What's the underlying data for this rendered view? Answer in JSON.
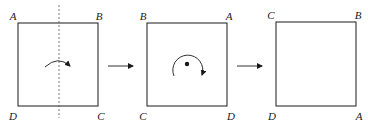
{
  "diagram": {
    "stroke_color": "#1a1a1a",
    "panels": [
      {
        "id": "panel-1",
        "labels": {
          "top_left": "A",
          "top_right": "B",
          "bottom_left": "D",
          "bottom_right": "C"
        },
        "annotation": "vertical dashed axis of reflection with curved flip arrow"
      },
      {
        "id": "panel-2",
        "labels": {
          "top_left": "B",
          "top_right": "A",
          "bottom_left": "C",
          "bottom_right": "D"
        },
        "annotation": "center point with clockwise rotation arrow"
      },
      {
        "id": "panel-3",
        "labels": {
          "top_left": "C",
          "top_right": "B",
          "bottom_left": "D",
          "bottom_right": "A"
        },
        "annotation": "result"
      }
    ],
    "transitions": [
      "right-arrow",
      "right-arrow"
    ]
  }
}
